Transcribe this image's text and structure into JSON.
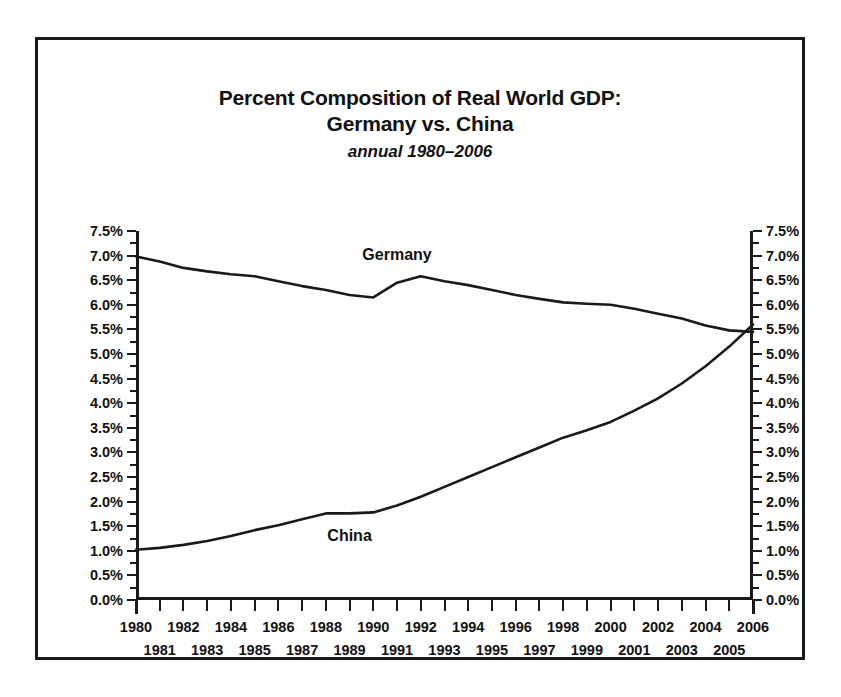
{
  "chart_data": {
    "type": "line",
    "title": "Percent Composition of Real World GDP:",
    "title_line2": "Germany vs. China",
    "subtitle": "annual 1980–2006",
    "xlabel": "",
    "ylabel": "",
    "ylim": [
      0.0,
      7.5
    ],
    "ytick_step": 0.5,
    "grid": false,
    "legend": "inline-labels",
    "dual_y_axis": true,
    "x": [
      1980,
      1981,
      1982,
      1983,
      1984,
      1985,
      1986,
      1987,
      1988,
      1989,
      1990,
      1991,
      1992,
      1993,
      1994,
      1995,
      1996,
      1997,
      1998,
      1999,
      2000,
      2001,
      2002,
      2003,
      2004,
      2005,
      2006
    ],
    "ytick_labels": [
      "0.0%",
      "0.5%",
      "1.0%",
      "1.5%",
      "2.0%",
      "2.5%",
      "3.0%",
      "3.5%",
      "4.0%",
      "4.5%",
      "5.0%",
      "5.5%",
      "6.0%",
      "6.5%",
      "7.0%",
      "7.5%"
    ],
    "ytick_values": [
      0.0,
      0.5,
      1.0,
      1.5,
      2.0,
      2.5,
      3.0,
      3.5,
      4.0,
      4.5,
      5.0,
      5.5,
      6.0,
      6.5,
      7.0,
      7.5
    ],
    "xtick_labels_top": [
      "1980",
      "1982",
      "1984",
      "1986",
      "1988",
      "1990",
      "1992",
      "1994",
      "1996",
      "1998",
      "2000",
      "2002",
      "2004",
      "2006"
    ],
    "xtick_labels_bottom": [
      "1981",
      "1983",
      "1985",
      "1987",
      "1989",
      "1991",
      "1993",
      "1995",
      "1997",
      "1999",
      "2001",
      "2003",
      "2005"
    ],
    "series": [
      {
        "name": "Germany",
        "color": "#1a1a1a",
        "label_x": 1991,
        "label_y": 7.0,
        "values": [
          6.98,
          6.88,
          6.75,
          6.68,
          6.62,
          6.58,
          6.48,
          6.38,
          6.3,
          6.2,
          6.15,
          6.45,
          6.58,
          6.48,
          6.4,
          6.3,
          6.2,
          6.12,
          6.05,
          6.02,
          6.0,
          5.92,
          5.82,
          5.72,
          5.58,
          5.48,
          5.45
        ]
      },
      {
        "name": "China",
        "color": "#1a1a1a",
        "label_x": 1989,
        "label_y": 1.28,
        "values": [
          1.02,
          1.06,
          1.12,
          1.2,
          1.3,
          1.42,
          1.52,
          1.64,
          1.76,
          1.76,
          1.78,
          1.92,
          2.1,
          2.3,
          2.5,
          2.7,
          2.9,
          3.1,
          3.3,
          3.45,
          3.62,
          3.85,
          4.1,
          4.4,
          4.75,
          5.15,
          5.6
        ]
      }
    ]
  },
  "title": {
    "line1": "Percent Composition of Real World GDP:",
    "line2": "Germany vs. China",
    "subtitle": "annual 1980–2006"
  }
}
